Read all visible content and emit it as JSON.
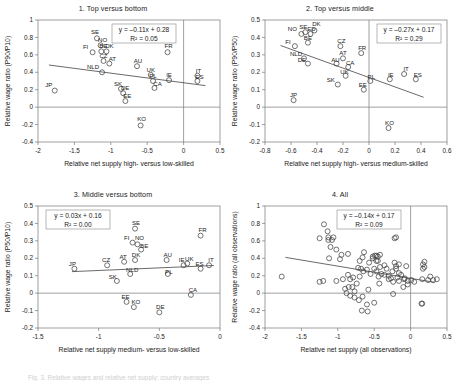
{
  "figure": {
    "caption": "Fig. 3. Relative wages and relative net supply: country averages"
  },
  "chart_data": [
    {
      "type": "scatter",
      "id": "panel1",
      "title": "1. Top versus bottom",
      "xlabel": "Relative net supply high- versus low-skilled",
      "ylabel": "Relative wage ratio (P90/P10)",
      "xlim": [
        -2,
        0.5
      ],
      "ylim": [
        -0.4,
        1
      ],
      "xticks": [
        -2,
        -1.5,
        -1,
        -0.5,
        0,
        0.5
      ],
      "xticklabels": [
        "-2",
        "-1.5",
        "-1",
        "-0.5",
        "0",
        "0.5"
      ],
      "yticks": [
        -0.4,
        -0.2,
        0,
        0.2,
        0.4,
        0.6,
        0.8,
        1
      ],
      "yticklabels": [
        "-0.4",
        "-0.2",
        "0",
        "0.2",
        "0.4",
        "0.6",
        "0.8",
        "1"
      ],
      "grid": false,
      "equation": "y = –0.11x + 0.28",
      "r2": "R² = 0.05",
      "fit": {
        "slope": -0.11,
        "intercept": 0.28,
        "x0": -1.85,
        "x1": 0.3
      },
      "points": [
        {
          "label": "JP",
          "x": -1.77,
          "y": 0.19,
          "lx": -6,
          "ly": -4
        },
        {
          "label": "SE",
          "x": -1.19,
          "y": 0.79,
          "lx": -2,
          "ly": -4
        },
        {
          "label": "NO",
          "x": -1.14,
          "y": 0.71,
          "lx": 2,
          "ly": -3
        },
        {
          "label": "FI",
          "x": -1.25,
          "y": 0.63,
          "lx": -7,
          "ly": -3
        },
        {
          "label": "BE",
          "x": -1.13,
          "y": 0.64,
          "lx": 2,
          "ly": -3
        },
        {
          "label": "DK",
          "x": -1.06,
          "y": 0.64,
          "lx": 3,
          "ly": -3
        },
        {
          "label": "CZ",
          "x": -1.1,
          "y": 0.53,
          "lx": 0,
          "ly": -3
        },
        {
          "label": "AT",
          "x": -1.02,
          "y": 0.5,
          "lx": 3,
          "ly": -3
        },
        {
          "label": "NLD",
          "x": -1.12,
          "y": 0.4,
          "lx": -9,
          "ly": -3
        },
        {
          "label": "AU",
          "x": -0.64,
          "y": 0.47,
          "lx": 1,
          "ly": -3
        },
        {
          "label": "UK",
          "x": -0.45,
          "y": 0.37,
          "lx": 0,
          "ly": -3
        },
        {
          "label": "PL",
          "x": -0.42,
          "y": 0.3,
          "lx": 0,
          "ly": -3
        },
        {
          "label": "CA",
          "x": -0.4,
          "y": 0.22,
          "lx": 3,
          "ly": -2
        },
        {
          "label": "IE",
          "x": -0.2,
          "y": 0.31,
          "lx": 0,
          "ly": -3
        },
        {
          "label": "IT",
          "x": 0.19,
          "y": 0.36,
          "lx": 1,
          "ly": -3
        },
        {
          "label": "ES",
          "x": 0.19,
          "y": 0.3,
          "lx": 2,
          "ly": -2
        },
        {
          "label": "FR",
          "x": -0.22,
          "y": 0.63,
          "lx": 1,
          "ly": -4
        },
        {
          "label": "SK",
          "x": -0.86,
          "y": 0.21,
          "lx": -3,
          "ly": -3
        },
        {
          "label": "DE",
          "x": -0.83,
          "y": 0.16,
          "lx": 2,
          "ly": -3
        },
        {
          "label": "EE",
          "x": -0.8,
          "y": 0.07,
          "lx": 2,
          "ly": -3
        },
        {
          "label": "KO",
          "x": -0.59,
          "y": -0.21,
          "lx": 1,
          "ly": -4
        }
      ]
    },
    {
      "type": "scatter",
      "id": "panel2",
      "title": "2. Top versus middle",
      "xlabel": "Relative net supply high- versus medium-skilled",
      "ylabel": "Relative wage ratio (P90/P50)",
      "xlim": [
        -0.8,
        0.6
      ],
      "ylim": [
        -0.2,
        0.5
      ],
      "xticks": [
        -0.8,
        -0.6,
        -0.4,
        -0.2,
        0,
        0.2,
        0.4,
        0.6
      ],
      "xticklabels": [
        "-0.8",
        "-0.6",
        "-0.4",
        "-0.2",
        "0",
        "0.2",
        "0.4",
        "0.6"
      ],
      "yticks": [
        -0.2,
        -0.1,
        0,
        0.1,
        0.2,
        0.3,
        0.4,
        0.5
      ],
      "yticklabels": [
        "-0.2",
        "-0.1",
        "0",
        "0.1",
        "0.2",
        "0.3",
        "0.4",
        "0.5"
      ],
      "grid": false,
      "equation": "y = –0.27x + 0.17",
      "r2": "R² = 0.29",
      "fit": {
        "slope": -0.27,
        "intercept": 0.17,
        "x0": -0.68,
        "x1": 0.42
      },
      "points": [
        {
          "label": "NO",
          "x": -0.52,
          "y": 0.42,
          "lx": -9,
          "ly": -3
        },
        {
          "label": "SE",
          "x": -0.49,
          "y": 0.43,
          "lx": -2,
          "ly": -3
        },
        {
          "label": "ED",
          "x": -0.45,
          "y": 0.42,
          "lx": 1,
          "ly": -3
        },
        {
          "label": "DK",
          "x": -0.42,
          "y": 0.44,
          "lx": 2,
          "ly": -4
        },
        {
          "label": "FI",
          "x": -0.57,
          "y": 0.35,
          "lx": -7,
          "ly": -2
        },
        {
          "label": "BE",
          "x": -0.47,
          "y": 0.37,
          "lx": 0,
          "ly": -3
        },
        {
          "label": "CZ",
          "x": -0.22,
          "y": 0.35,
          "lx": 1,
          "ly": -3
        },
        {
          "label": "FR",
          "x": -0.06,
          "y": 0.31,
          "lx": 1,
          "ly": -3
        },
        {
          "label": "AT",
          "x": -0.2,
          "y": 0.28,
          "lx": 0,
          "ly": -3
        },
        {
          "label": "NLD",
          "x": -0.5,
          "y": 0.28,
          "lx": -8,
          "ly": -2
        },
        {
          "label": "DE",
          "x": -0.47,
          "y": 0.25,
          "lx": -6,
          "ly": -2
        },
        {
          "label": "AU",
          "x": -0.25,
          "y": 0.25,
          "lx": -1,
          "ly": -2
        },
        {
          "label": "CA",
          "x": -0.16,
          "y": 0.23,
          "lx": 2,
          "ly": -2
        },
        {
          "label": "UK",
          "x": -0.18,
          "y": 0.18,
          "lx": -1,
          "ly": -2
        },
        {
          "label": "SK",
          "x": -0.24,
          "y": 0.13,
          "lx": -7,
          "ly": -2
        },
        {
          "label": "PL",
          "x": 0.01,
          "y": 0.15,
          "lx": 1,
          "ly": -2
        },
        {
          "label": "EE",
          "x": -0.04,
          "y": 0.1,
          "lx": -1,
          "ly": -3
        },
        {
          "label": "IE",
          "x": 0.16,
          "y": 0.16,
          "lx": 1,
          "ly": -2
        },
        {
          "label": "IT",
          "x": 0.27,
          "y": 0.19,
          "lx": 2,
          "ly": -3
        },
        {
          "label": "ES",
          "x": 0.36,
          "y": 0.16,
          "lx": 2,
          "ly": -2
        },
        {
          "label": "JP",
          "x": -0.58,
          "y": 0.04,
          "lx": 0,
          "ly": -3
        },
        {
          "label": "KO",
          "x": 0.15,
          "y": -0.12,
          "lx": 1,
          "ly": -3
        }
      ]
    },
    {
      "type": "scatter",
      "id": "panel3",
      "title": "3. Middle versus bottom",
      "xlabel": "Relative net supply medium- versus low-skilled",
      "ylabel": "Relative wage ratio (P50/P10)",
      "xlim": [
        -1.5,
        0
      ],
      "ylim": [
        -0.2,
        0.5
      ],
      "xticks": [
        -1.5,
        -1,
        -0.5,
        0
      ],
      "xticklabels": [
        "-1.5",
        "-1",
        "-0.5",
        "0"
      ],
      "yticks": [
        -0.2,
        -0.1,
        0,
        0.1,
        0.2,
        0.3,
        0.4,
        0.5
      ],
      "yticklabels": [
        "-0.2",
        "-0.1",
        "0",
        "0.1",
        "0.2",
        "0.3",
        "0.4",
        "0.5"
      ],
      "grid": false,
      "equation": "y = 0.03x + 0.16",
      "r2": "R² = 0.00",
      "fit": {
        "slope": 0.03,
        "intercept": 0.16,
        "x0": -1.22,
        "x1": -0.05
      },
      "points": [
        {
          "label": "JP",
          "x": -1.2,
          "y": 0.14,
          "lx": -2,
          "ly": -3
        },
        {
          "label": "CZ",
          "x": -0.93,
          "y": 0.16,
          "lx": -1,
          "ly": -3
        },
        {
          "label": "SE",
          "x": -0.7,
          "y": 0.37,
          "lx": 1,
          "ly": -4
        },
        {
          "label": "FI",
          "x": -0.72,
          "y": 0.29,
          "lx": -6,
          "ly": -3
        },
        {
          "label": "NO",
          "x": -0.68,
          "y": 0.28,
          "lx": 2,
          "ly": -4
        },
        {
          "label": "BE",
          "x": -0.65,
          "y": 0.25,
          "lx": 3,
          "ly": -2
        },
        {
          "label": "AT",
          "x": -0.79,
          "y": 0.18,
          "lx": -1,
          "ly": -3
        },
        {
          "label": "DK",
          "x": -0.7,
          "y": 0.19,
          "lx": 1,
          "ly": -3
        },
        {
          "label": "AU",
          "x": -0.44,
          "y": 0.19,
          "lx": 1,
          "ly": -3
        },
        {
          "label": "IE",
          "x": -0.3,
          "y": 0.16,
          "lx": -2,
          "ly": -3
        },
        {
          "label": "UK",
          "x": -0.27,
          "y": 0.17,
          "lx": 2,
          "ly": -3
        },
        {
          "label": "ES",
          "x": -0.16,
          "y": 0.14,
          "lx": -1,
          "ly": -3
        },
        {
          "label": "IT",
          "x": -0.09,
          "y": 0.16,
          "lx": 2,
          "ly": -3
        },
        {
          "label": "FR",
          "x": -0.16,
          "y": 0.33,
          "lx": 2,
          "ly": -4
        },
        {
          "label": "PL",
          "x": -0.43,
          "y": 0.11,
          "lx": 1,
          "ly": 0
        },
        {
          "label": "SK",
          "x": -0.85,
          "y": 0.07,
          "lx": -4,
          "ly": -2
        },
        {
          "label": "NLD",
          "x": -0.74,
          "y": 0.11,
          "lx": 2,
          "ly": -2
        },
        {
          "label": "CA",
          "x": -0.24,
          "y": -0.01,
          "lx": 2,
          "ly": -3
        },
        {
          "label": "EE",
          "x": -0.77,
          "y": -0.05,
          "lx": -1,
          "ly": -3
        },
        {
          "label": "KO",
          "x": -0.71,
          "y": -0.08,
          "lx": 2,
          "ly": -3
        },
        {
          "label": "DE",
          "x": -0.5,
          "y": -0.11,
          "lx": 1,
          "ly": -3
        }
      ]
    },
    {
      "type": "scatter",
      "id": "panel4",
      "title": "4. All",
      "xlabel": "Relative net supply (all observations)",
      "ylabel": "Relative wage ratio (all observations)",
      "xlim": [
        -2,
        0.5
      ],
      "ylim": [
        -0.4,
        1
      ],
      "xticks": [
        -2,
        -1.5,
        -1,
        -0.5,
        0,
        0.5
      ],
      "xticklabels": [
        "-2",
        "-1.5",
        "-1",
        "-0.5",
        "0",
        "0.5"
      ],
      "yticks": [
        -0.4,
        -0.2,
        0,
        0.2,
        0.4,
        0.6,
        0.8,
        1
      ],
      "yticklabels": [
        "-0.4",
        "-0.2",
        "0",
        "0.2",
        "0.4",
        "0.6",
        "0.8",
        "1"
      ],
      "grid": false,
      "equation": "y = –0.14x + 0.17",
      "r2": "R² = 0.09",
      "fit": {
        "slope": -0.14,
        "intercept": 0.17,
        "x0": -1.72,
        "x1": 0.33
      },
      "points": [
        {
          "x": -1.77,
          "y": 0.19
        },
        {
          "x": -1.19,
          "y": 0.79
        },
        {
          "x": -1.14,
          "y": 0.71
        },
        {
          "x": -1.25,
          "y": 0.63
        },
        {
          "x": -1.13,
          "y": 0.64
        },
        {
          "x": -1.06,
          "y": 0.64
        },
        {
          "x": -1.1,
          "y": 0.53
        },
        {
          "x": -1.02,
          "y": 0.5
        },
        {
          "x": -1.12,
          "y": 0.4
        },
        {
          "x": -0.64,
          "y": 0.47
        },
        {
          "x": -0.45,
          "y": 0.37
        },
        {
          "x": -0.42,
          "y": 0.3
        },
        {
          "x": -0.4,
          "y": 0.22
        },
        {
          "x": -0.2,
          "y": 0.31
        },
        {
          "x": 0.19,
          "y": 0.36
        },
        {
          "x": 0.19,
          "y": 0.3
        },
        {
          "x": -0.22,
          "y": 0.63
        },
        {
          "x": -0.86,
          "y": 0.21
        },
        {
          "x": -0.83,
          "y": 0.16
        },
        {
          "x": -0.8,
          "y": 0.07
        },
        {
          "x": -0.59,
          "y": -0.21
        },
        {
          "x": -0.52,
          "y": 0.42
        },
        {
          "x": -0.49,
          "y": 0.43
        },
        {
          "x": -0.45,
          "y": 0.42
        },
        {
          "x": -0.42,
          "y": 0.44
        },
        {
          "x": -0.57,
          "y": 0.35
        },
        {
          "x": -0.47,
          "y": 0.37
        },
        {
          "x": -0.22,
          "y": 0.35
        },
        {
          "x": -0.06,
          "y": 0.31
        },
        {
          "x": -0.2,
          "y": 0.28
        },
        {
          "x": -0.5,
          "y": 0.28
        },
        {
          "x": -0.47,
          "y": 0.25
        },
        {
          "x": -0.25,
          "y": 0.25
        },
        {
          "x": -0.16,
          "y": 0.23
        },
        {
          "x": -0.18,
          "y": 0.18
        },
        {
          "x": -0.24,
          "y": 0.13
        },
        {
          "x": 0.01,
          "y": 0.15
        },
        {
          "x": -0.04,
          "y": 0.1
        },
        {
          "x": 0.16,
          "y": 0.16
        },
        {
          "x": 0.27,
          "y": 0.19
        },
        {
          "x": 0.36,
          "y": 0.16
        },
        {
          "x": -0.58,
          "y": 0.04
        },
        {
          "x": 0.15,
          "y": -0.12
        },
        {
          "x": -1.2,
          "y": 0.14
        },
        {
          "x": -0.93,
          "y": 0.16
        },
        {
          "x": -0.7,
          "y": 0.37
        },
        {
          "x": -0.72,
          "y": 0.29
        },
        {
          "x": -0.68,
          "y": 0.28
        },
        {
          "x": -0.65,
          "y": 0.25
        },
        {
          "x": -0.79,
          "y": 0.18
        },
        {
          "x": -0.7,
          "y": 0.19
        },
        {
          "x": -0.44,
          "y": 0.19
        },
        {
          "x": -0.3,
          "y": 0.16
        },
        {
          "x": -0.27,
          "y": 0.17
        },
        {
          "x": -0.16,
          "y": 0.14
        },
        {
          "x": -0.09,
          "y": 0.16
        },
        {
          "x": -0.16,
          "y": 0.33
        },
        {
          "x": -0.43,
          "y": 0.11
        },
        {
          "x": -0.85,
          "y": 0.07
        },
        {
          "x": -0.74,
          "y": 0.11
        },
        {
          "x": -0.24,
          "y": -0.01
        },
        {
          "x": -0.77,
          "y": -0.05
        },
        {
          "x": -0.71,
          "y": -0.08
        },
        {
          "x": -0.5,
          "y": -0.11
        },
        {
          "x": -1.13,
          "y": 0.61
        },
        {
          "x": -1.08,
          "y": 0.61
        },
        {
          "x": -0.95,
          "y": 0.44
        },
        {
          "x": -0.86,
          "y": 0.45
        },
        {
          "x": -0.97,
          "y": 0.39
        },
        {
          "x": -0.66,
          "y": 0.41
        },
        {
          "x": -0.52,
          "y": 0.4
        },
        {
          "x": -0.47,
          "y": 0.43
        },
        {
          "x": -0.36,
          "y": 0.32
        },
        {
          "x": -0.33,
          "y": 0.28
        },
        {
          "x": -0.55,
          "y": 0.22
        },
        {
          "x": -0.6,
          "y": 0.27
        },
        {
          "x": -0.9,
          "y": 0.05
        },
        {
          "x": -0.88,
          "y": 0.0
        },
        {
          "x": -0.77,
          "y": 0.02
        },
        {
          "x": -0.83,
          "y": -0.03
        },
        {
          "x": -0.66,
          "y": -0.04
        },
        {
          "x": -0.6,
          "y": -0.13
        },
        {
          "x": -0.67,
          "y": -0.2
        },
        {
          "x": -1.25,
          "y": 0.13
        },
        {
          "x": -1.02,
          "y": 0.14
        },
        {
          "x": -0.2,
          "y": 0.64
        },
        {
          "x": 0.17,
          "y": 0.33
        },
        {
          "x": 0.17,
          "y": 0.28
        },
        {
          "x": 0.16,
          "y": -0.12
        },
        {
          "x": -0.13,
          "y": 0.21
        },
        {
          "x": -0.08,
          "y": 0.17
        },
        {
          "x": -0.04,
          "y": 0.14
        },
        {
          "x": 0.05,
          "y": 0.13
        },
        {
          "x": 0.24,
          "y": 0.15
        },
        {
          "x": 0.31,
          "y": 0.15
        },
        {
          "x": -0.3,
          "y": 0.2
        },
        {
          "x": -0.36,
          "y": 0.21
        },
        {
          "x": -0.1,
          "y": 0.07
        }
      ]
    }
  ]
}
